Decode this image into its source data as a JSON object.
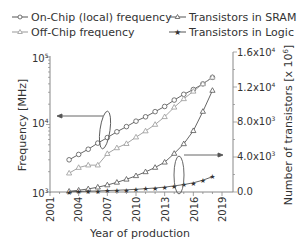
{
  "chart_data": {
    "type": "line",
    "title": "",
    "xlabel": "Year of production",
    "ylabel_left": "Frequency [MHz]",
    "ylabel_right": "Number of transistors [x 10^6]",
    "x_ticks": [
      "2001",
      "2004",
      "2007",
      "2010",
      "2013",
      "2016",
      "2019"
    ],
    "y_left_ticks": [
      "10^3",
      "10^4",
      "10^5"
    ],
    "y_left_scale": "log",
    "y_left_range": [
      1000,
      100000
    ],
    "y_right_ticks": [
      "0.0",
      "4.0x10^3",
      "8.0x10^3",
      "1.2x10^4",
      "1.6x10^4"
    ],
    "y_right_range": [
      0,
      16000
    ],
    "x": [
      2003,
      2004,
      2005,
      2006,
      2007,
      2008,
      2009,
      2010,
      2011,
      2012,
      2013,
      2014,
      2015,
      2016,
      2017,
      2018
    ],
    "series": [
      {
        "name": "On-Chip (local) frequency",
        "axis": "left",
        "marker": "circle",
        "values": [
          3000,
          3600,
          4300,
          5300,
          6400,
          7800,
          9300,
          11200,
          13000,
          15500,
          18500,
          23000,
          28000,
          33000,
          40000,
          50000
        ]
      },
      {
        "name": "Off-Chip frequency",
        "axis": "left",
        "marker": "triangle",
        "color": "#999999",
        "values": [
          1900,
          2300,
          2500,
          2500,
          3700,
          4500,
          5200,
          6500,
          8000,
          10000,
          13000,
          18000,
          24000,
          31000,
          40000,
          50000
        ]
      },
      {
        "name": "Transistors in SRAM",
        "axis": "right",
        "marker": "triangle",
        "values": [
          80,
          200,
          350,
          550,
          800,
          1100,
          1450,
          1850,
          2300,
          2800,
          3400,
          4400,
          5500,
          7000,
          9200,
          11600
        ]
      },
      {
        "name": "Transistors in Logic",
        "axis": "right",
        "marker": "star",
        "values": [
          30,
          60,
          90,
          120,
          160,
          200,
          250,
          310,
          380,
          460,
          560,
          700,
          850,
          1050,
          1350,
          1750
        ]
      }
    ],
    "legend": [
      "On-Chip (local) frequency",
      "Off-Chip frequency",
      "Transistors in SRAM",
      "Transistors in Logic"
    ],
    "legend_position": "top",
    "grid": false,
    "annotations": [
      {
        "type": "ellipse-arrow",
        "target": "left-axis",
        "groups": [
          "On-Chip (local) frequency",
          "Off-Chip frequency"
        ]
      },
      {
        "type": "ellipse-arrow",
        "target": "right-axis",
        "groups": [
          "Transistors in SRAM",
          "Transistors in Logic"
        ]
      }
    ]
  },
  "legend": {
    "on_chip": "On-Chip (local) frequency",
    "off_chip": "Off-Chip frequency",
    "sram": "Transistors in SRAM",
    "logic": "Transistors in Logic"
  },
  "axes": {
    "xlabel": "Year of production",
    "ylabel_left": "Frequency [MHz]",
    "ylabel_right": "Number of transistors [x 10",
    "ylabel_right_sup": "6",
    "ylabel_right_end": "]",
    "x_ticks": [
      "2001",
      "2004",
      "2007",
      "2010",
      "2013",
      "2016",
      "2019"
    ],
    "left_ticks": [
      {
        "base": "10",
        "exp": "5"
      },
      {
        "base": "10",
        "exp": "4"
      },
      {
        "base": "10",
        "exp": "3"
      }
    ],
    "right_ticks": [
      {
        "base": "1.6x10",
        "exp": "4"
      },
      {
        "base": "1.2x10",
        "exp": "4"
      },
      {
        "base": "8.0x10",
        "exp": "3"
      },
      {
        "base": "4.0x10",
        "exp": "3"
      },
      {
        "base": "0.0",
        "exp": ""
      }
    ]
  }
}
